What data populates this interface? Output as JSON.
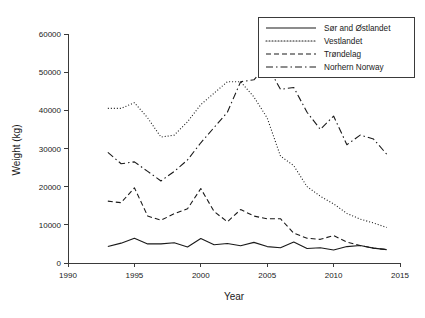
{
  "chart_data": {
    "type": "line",
    "title": "",
    "xlabel": "Year",
    "ylabel": "Weight (kg)",
    "xlim": [
      1990,
      2015
    ],
    "ylim": [
      0,
      60000
    ],
    "xticks": [
      1990,
      1995,
      2000,
      2005,
      2010,
      2015
    ],
    "yticks": [
      0,
      10000,
      20000,
      30000,
      40000,
      50000,
      60000
    ],
    "grid": false,
    "legend_position": "top-right",
    "x": [
      1993,
      1994,
      1995,
      1996,
      1997,
      1998,
      1999,
      2000,
      2001,
      2002,
      2003,
      2004,
      2005,
      2006,
      2007,
      2008,
      2009,
      2010,
      2011,
      2012,
      2013,
      2014
    ],
    "series": [
      {
        "name": "Sør and  Østlandet",
        "style": "solid",
        "values": [
          4300,
          5200,
          6500,
          5000,
          5000,
          5300,
          4200,
          6400,
          4800,
          5100,
          4500,
          5400,
          4300,
          4000,
          5500,
          3800,
          4000,
          3400,
          4300,
          4600,
          3900,
          3500
        ]
      },
      {
        "name": "Vestlandet",
        "style": "dotted",
        "values": [
          40500,
          40500,
          42000,
          38000,
          33000,
          33500,
          37000,
          41500,
          44500,
          47500,
          47500,
          43500,
          38000,
          28000,
          25500,
          20000,
          17500,
          15500,
          13000,
          11500,
          10500,
          9300
        ]
      },
      {
        "name": "Trøndelag",
        "style": "dashed",
        "values": [
          16200,
          15800,
          19700,
          12300,
          11200,
          12900,
          14200,
          19500,
          13500,
          10800,
          14000,
          12300,
          11600,
          11600,
          7800,
          6500,
          6200,
          7200,
          5500,
          4600,
          3900,
          3500
        ]
      },
      {
        "name": "Norhern Norway",
        "style": "dashdot",
        "values": [
          29000,
          26000,
          26500,
          24000,
          21500,
          24000,
          27000,
          31500,
          35500,
          39500,
          47500,
          48000,
          51800,
          45500,
          46000,
          39500,
          35000,
          38500,
          31000,
          33500,
          32500,
          28500
        ]
      }
    ]
  },
  "legend": {
    "items": [
      {
        "label": "Sør and  Østlandet",
        "style": "solid"
      },
      {
        "label": "Vestlandet",
        "style": "dotted"
      },
      {
        "label": "Trøndelag",
        "style": "dashed"
      },
      {
        "label": "Norhern Norway",
        "style": "dashdot"
      }
    ]
  },
  "axes": {
    "x_title": "Year",
    "y_title": "Weight (kg)",
    "x_tick_labels": [
      "1990",
      "1995",
      "2000",
      "2005",
      "2010",
      "2015"
    ],
    "y_tick_labels": [
      "0",
      "10000",
      "20000",
      "30000",
      "40000",
      "50000",
      "60000"
    ]
  },
  "colors": {
    "ink": "#1a1a1a",
    "axis": "#3a3a3a",
    "background": "#ffffff"
  }
}
